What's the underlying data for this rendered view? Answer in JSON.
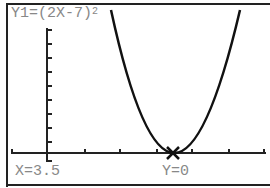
{
  "calculator_screen": {
    "equation_label": "Y1=(2X-7)",
    "equation_exponent": "2",
    "trace_x": "X=3.5",
    "trace_y": "Y=0"
  },
  "graph": {
    "function": "(2X-7)^2",
    "trace_point": {
      "x": 3.5,
      "y": 0
    },
    "x_axis_ticks": 8,
    "y_axis_ticks": 10,
    "colors": {
      "curve": "#111111",
      "axes": "#222222",
      "text": "#888888"
    }
  }
}
